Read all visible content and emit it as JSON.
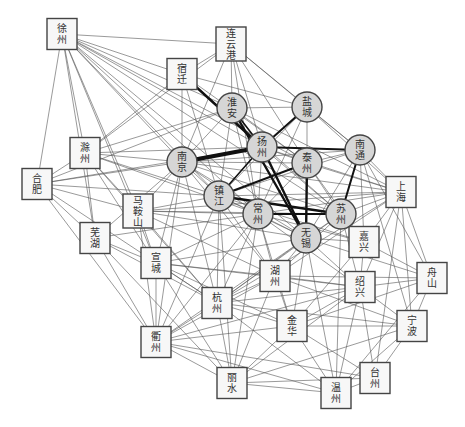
{
  "chart_data": {
    "type": "network",
    "title": "",
    "node_styles": {
      "core": "circle-gray",
      "peripheral": "square-white"
    },
    "nodes": [
      {
        "id": "xuzhou",
        "label": [
          "徐",
          "州"
        ],
        "shape": "box",
        "x": 62,
        "y": 34
      },
      {
        "id": "lianyungang",
        "label": [
          "连",
          "云",
          "港"
        ],
        "shape": "box",
        "x": 231,
        "y": 44
      },
      {
        "id": "suqian",
        "label": [
          "宿",
          "迁"
        ],
        "shape": "box",
        "x": 182,
        "y": 74
      },
      {
        "id": "chuzhou",
        "label": [
          "滁",
          "州"
        ],
        "shape": "box",
        "x": 85,
        "y": 153
      },
      {
        "id": "hefei",
        "label": [
          "合",
          "肥"
        ],
        "shape": "box",
        "x": 37,
        "y": 184
      },
      {
        "id": "maanshan",
        "label": [
          "马",
          "鞍",
          "山"
        ],
        "shape": "box",
        "x": 138,
        "y": 211
      },
      {
        "id": "wuhu",
        "label": [
          "芜",
          "湖"
        ],
        "shape": "box",
        "x": 95,
        "y": 238
      },
      {
        "id": "xuancheng",
        "label": [
          "宣",
          "城"
        ],
        "shape": "box",
        "x": 156,
        "y": 263
      },
      {
        "id": "hangzhou",
        "label": [
          "杭",
          "州"
        ],
        "shape": "box",
        "x": 217,
        "y": 303
      },
      {
        "id": "huzhou",
        "label": [
          "湖",
          "州"
        ],
        "shape": "box",
        "x": 275,
        "y": 276
      },
      {
        "id": "quzhou",
        "label": [
          "衢",
          "州"
        ],
        "shape": "box",
        "x": 156,
        "y": 342
      },
      {
        "id": "lishui",
        "label": [
          "丽",
          "水"
        ],
        "shape": "box",
        "x": 232,
        "y": 383
      },
      {
        "id": "jinhua",
        "label": [
          "金",
          "华"
        ],
        "shape": "box",
        "x": 292,
        "y": 326
      },
      {
        "id": "wenzhou",
        "label": [
          "温",
          "州"
        ],
        "shape": "box",
        "x": 336,
        "y": 393
      },
      {
        "id": "taizhou_zj",
        "label": [
          "台",
          "州"
        ],
        "shape": "box",
        "x": 375,
        "y": 378
      },
      {
        "id": "shaoxing",
        "label": [
          "绍",
          "兴"
        ],
        "shape": "box",
        "x": 360,
        "y": 287
      },
      {
        "id": "ningbo",
        "label": [
          "宁",
          "波"
        ],
        "shape": "box",
        "x": 412,
        "y": 326
      },
      {
        "id": "zhoushan",
        "label": [
          "舟",
          "山"
        ],
        "shape": "box",
        "x": 432,
        "y": 278
      },
      {
        "id": "jiaxing",
        "label": [
          "嘉",
          "兴"
        ],
        "shape": "box",
        "x": 364,
        "y": 242
      },
      {
        "id": "shanghai",
        "label": [
          "上",
          "海"
        ],
        "shape": "box",
        "x": 401,
        "y": 192
      },
      {
        "id": "huaian",
        "label": [
          "淮",
          "安"
        ],
        "shape": "circle",
        "x": 232,
        "y": 108
      },
      {
        "id": "yancheng",
        "label": [
          "盐",
          "城"
        ],
        "shape": "circle",
        "x": 307,
        "y": 107
      },
      {
        "id": "yangzhou",
        "label": [
          "扬",
          "州"
        ],
        "shape": "circle",
        "x": 262,
        "y": 147
      },
      {
        "id": "taizhou_js",
        "label": [
          "泰",
          "州"
        ],
        "shape": "circle",
        "x": 307,
        "y": 163
      },
      {
        "id": "nantong",
        "label": [
          "南",
          "通"
        ],
        "shape": "circle",
        "x": 360,
        "y": 150
      },
      {
        "id": "nanjing",
        "label": [
          "南",
          "京"
        ],
        "shape": "circle",
        "x": 182,
        "y": 162
      },
      {
        "id": "zhenjiang",
        "label": [
          "镇",
          "江"
        ],
        "shape": "circle",
        "x": 219,
        "y": 196
      },
      {
        "id": "changzhou",
        "label": [
          "常",
          "州"
        ],
        "shape": "circle",
        "x": 258,
        "y": 214
      },
      {
        "id": "suzhou",
        "label": [
          "苏",
          "州"
        ],
        "shape": "circle",
        "x": 341,
        "y": 214
      },
      {
        "id": "wuxi",
        "label": [
          "无",
          "锡"
        ],
        "shape": "circle",
        "x": 306,
        "y": 238
      }
    ],
    "strong_edges": [
      {
        "from": "nanjing",
        "to": "yangzhou",
        "weight": 4
      },
      {
        "from": "suqian",
        "to": "yangzhou",
        "weight": 2.4
      },
      {
        "from": "huaian",
        "to": "wuxi",
        "weight": 2.4
      },
      {
        "from": "yangzhou",
        "to": "wuxi",
        "weight": 2.4
      },
      {
        "from": "yancheng",
        "to": "yangzhou",
        "weight": 2
      },
      {
        "from": "yangzhou",
        "to": "nantong",
        "weight": 2
      },
      {
        "from": "zhenjiang",
        "to": "taizhou_js",
        "weight": 2
      },
      {
        "from": "zhenjiang",
        "to": "suzhou",
        "weight": 2.4
      },
      {
        "from": "changzhou",
        "to": "suzhou",
        "weight": 2
      },
      {
        "from": "taizhou_js",
        "to": "wuxi",
        "weight": 2.4
      },
      {
        "from": "nantong",
        "to": "suzhou",
        "weight": 2
      },
      {
        "from": "huaian",
        "to": "yangzhou",
        "weight": 1.6
      },
      {
        "from": "zhenjiang",
        "to": "yangzhou",
        "weight": 1.6
      }
    ],
    "weak_edges": [
      [
        "xuzhou",
        "lianyungang"
      ],
      [
        "xuzhou",
        "suqian"
      ],
      [
        "xuzhou",
        "huaian"
      ],
      [
        "xuzhou",
        "yangzhou"
      ],
      [
        "xuzhou",
        "nanjing"
      ],
      [
        "xuzhou",
        "zhenjiang"
      ],
      [
        "xuzhou",
        "chuzhou"
      ],
      [
        "xuzhou",
        "hefei"
      ],
      [
        "xuzhou",
        "maanshan"
      ],
      [
        "xuzhou",
        "wuhu"
      ],
      [
        "xuzhou",
        "changzhou"
      ],
      [
        "xuzhou",
        "wuxi"
      ],
      [
        "xuzhou",
        "suzhou"
      ],
      [
        "xuzhou",
        "taizhou_js"
      ],
      [
        "xuzhou",
        "xuancheng"
      ],
      [
        "lianyungang",
        "huaian"
      ],
      [
        "lianyungang",
        "yancheng"
      ],
      [
        "lianyungang",
        "suqian"
      ],
      [
        "lianyungang",
        "nanjing"
      ],
      [
        "lianyungang",
        "yangzhou"
      ],
      [
        "lianyungang",
        "taizhou_js"
      ],
      [
        "lianyungang",
        "changzhou"
      ],
      [
        "lianyungang",
        "nantong"
      ],
      [
        "lianyungang",
        "chuzhou"
      ],
      [
        "suqian",
        "nanjing"
      ],
      [
        "suqian",
        "yancheng"
      ],
      [
        "suqian",
        "taizhou_js"
      ],
      [
        "suqian",
        "chuzhou"
      ],
      [
        "suqian",
        "suzhou"
      ],
      [
        "suqian",
        "zhenjiang"
      ],
      [
        "huaian",
        "yancheng"
      ],
      [
        "huaian",
        "nanjing"
      ],
      [
        "huaian",
        "chuzhou"
      ],
      [
        "huaian",
        "taizhou_js"
      ],
      [
        "huaian",
        "zhenjiang"
      ],
      [
        "huaian",
        "changzhou"
      ],
      [
        "huaian",
        "hefei"
      ],
      [
        "huaian",
        "shanghai"
      ],
      [
        "yancheng",
        "taizhou_js"
      ],
      [
        "yancheng",
        "nantong"
      ],
      [
        "yancheng",
        "zhenjiang"
      ],
      [
        "yancheng",
        "changzhou"
      ],
      [
        "yancheng",
        "shanghai"
      ],
      [
        "chuzhou",
        "hefei"
      ],
      [
        "chuzhou",
        "nanjing"
      ],
      [
        "chuzhou",
        "maanshan"
      ],
      [
        "chuzhou",
        "wuhu"
      ],
      [
        "chuzhou",
        "yangzhou"
      ],
      [
        "chuzhou",
        "zhenjiang"
      ],
      [
        "chuzhou",
        "xuancheng"
      ],
      [
        "chuzhou",
        "changzhou"
      ],
      [
        "chuzhou",
        "hangzhou"
      ],
      [
        "hefei",
        "nanjing"
      ],
      [
        "hefei",
        "maanshan"
      ],
      [
        "hefei",
        "wuhu"
      ],
      [
        "hefei",
        "quzhou"
      ],
      [
        "hefei",
        "zhenjiang"
      ],
      [
        "hefei",
        "yangzhou"
      ],
      [
        "hefei",
        "hangzhou"
      ],
      [
        "maanshan",
        "nanjing"
      ],
      [
        "maanshan",
        "zhenjiang"
      ],
      [
        "maanshan",
        "xuancheng"
      ],
      [
        "maanshan",
        "changzhou"
      ],
      [
        "maanshan",
        "wuxi"
      ],
      [
        "maanshan",
        "suzhou"
      ],
      [
        "maanshan",
        "hangzhou"
      ],
      [
        "maanshan",
        "huzhou"
      ],
      [
        "maanshan",
        "shanghai"
      ],
      [
        "maanshan",
        "quzhou"
      ],
      [
        "wuhu",
        "nanjing"
      ],
      [
        "wuhu",
        "xuancheng"
      ],
      [
        "wuhu",
        "quzhou"
      ],
      [
        "wuhu",
        "hangzhou"
      ],
      [
        "wuhu",
        "lishui"
      ],
      [
        "wuhu",
        "changzhou"
      ],
      [
        "xuancheng",
        "nanjing"
      ],
      [
        "xuancheng",
        "quzhou"
      ],
      [
        "xuancheng",
        "hangzhou"
      ],
      [
        "xuancheng",
        "huzhou"
      ],
      [
        "xuancheng",
        "jinhua"
      ],
      [
        "xuancheng",
        "changzhou"
      ],
      [
        "xuancheng",
        "wuxi"
      ],
      [
        "xuancheng",
        "shaoxing"
      ],
      [
        "xuancheng",
        "lishui"
      ],
      [
        "nanjing",
        "zhenjiang"
      ],
      [
        "nanjing",
        "changzhou"
      ],
      [
        "nanjing",
        "wuxi"
      ],
      [
        "nanjing",
        "suzhou"
      ],
      [
        "nanjing",
        "taizhou_js"
      ],
      [
        "nanjing",
        "hangzhou"
      ],
      [
        "nanjing",
        "quzhou"
      ],
      [
        "nanjing",
        "huzhou"
      ],
      [
        "nanjing",
        "shanghai"
      ],
      [
        "nanjing",
        "nantong"
      ],
      [
        "zhenjiang",
        "changzhou"
      ],
      [
        "zhenjiang",
        "wuxi"
      ],
      [
        "zhenjiang",
        "quzhou"
      ],
      [
        "zhenjiang",
        "hangzhou"
      ],
      [
        "zhenjiang",
        "lishui"
      ],
      [
        "zhenjiang",
        "huzhou"
      ],
      [
        "zhenjiang",
        "shanghai"
      ],
      [
        "zhenjiang",
        "jiaxing"
      ],
      [
        "zhenjiang",
        "nantong"
      ],
      [
        "changzhou",
        "wuxi"
      ],
      [
        "changzhou",
        "huzhou"
      ],
      [
        "changzhou",
        "hangzhou"
      ],
      [
        "changzhou",
        "quzhou"
      ],
      [
        "changzhou",
        "shaoxing"
      ],
      [
        "changzhou",
        "jinhua"
      ],
      [
        "changzhou",
        "shanghai"
      ],
      [
        "changzhou",
        "jiaxing"
      ],
      [
        "changzhou",
        "lishui"
      ],
      [
        "yangzhou",
        "taizhou_js"
      ],
      [
        "yangzhou",
        "suzhou"
      ],
      [
        "yangzhou",
        "changzhou"
      ],
      [
        "yangzhou",
        "shanghai"
      ],
      [
        "taizhou_js",
        "nantong"
      ],
      [
        "taizhou_js",
        "suzhou"
      ],
      [
        "taizhou_js",
        "changzhou"
      ],
      [
        "taizhou_js",
        "shanghai"
      ],
      [
        "taizhou_js",
        "jiaxing"
      ],
      [
        "nantong",
        "shanghai"
      ],
      [
        "nantong",
        "wuxi"
      ],
      [
        "nantong",
        "jiaxing"
      ],
      [
        "nantong",
        "ningbo"
      ],
      [
        "nantong",
        "zhoushan"
      ],
      [
        "suzhou",
        "wuxi"
      ],
      [
        "suzhou",
        "shanghai"
      ],
      [
        "suzhou",
        "jiaxing"
      ],
      [
        "suzhou",
        "huzhou"
      ],
      [
        "suzhou",
        "shaoxing"
      ],
      [
        "suzhou",
        "wenzhou"
      ],
      [
        "suzhou",
        "hangzhou"
      ],
      [
        "wuxi",
        "huzhou"
      ],
      [
        "wuxi",
        "jiaxing"
      ],
      [
        "wuxi",
        "shaoxing"
      ],
      [
        "wuxi",
        "jinhua"
      ],
      [
        "wuxi",
        "hangzhou"
      ],
      [
        "wuxi",
        "wenzhou"
      ],
      [
        "wuxi",
        "quzhou"
      ],
      [
        "wuxi",
        "zhoushan"
      ],
      [
        "shanghai",
        "jiaxing"
      ],
      [
        "shanghai",
        "shaoxing"
      ],
      [
        "shanghai",
        "zhoushan"
      ],
      [
        "shanghai",
        "ningbo"
      ],
      [
        "shanghai",
        "taizhou_zj"
      ],
      [
        "shanghai",
        "hangzhou"
      ],
      [
        "shanghai",
        "huzhou"
      ],
      [
        "jiaxing",
        "shaoxing"
      ],
      [
        "jiaxing",
        "zhoushan"
      ],
      [
        "jiaxing",
        "jinhua"
      ],
      [
        "huzhou",
        "shaoxing"
      ],
      [
        "huzhou",
        "hangzhou"
      ],
      [
        "huzhou",
        "jinhua"
      ],
      [
        "huzhou",
        "quzhou"
      ],
      [
        "huzhou",
        "lishui"
      ],
      [
        "huzhou",
        "zhoushan"
      ],
      [
        "huzhou",
        "ningbo"
      ],
      [
        "hangzhou",
        "quzhou"
      ],
      [
        "hangzhou",
        "lishui"
      ],
      [
        "hangzhou",
        "jinhua"
      ],
      [
        "hangzhou",
        "shaoxing"
      ],
      [
        "hangzhou",
        "wenzhou"
      ],
      [
        "hangzhou",
        "ningbo"
      ],
      [
        "shaoxing",
        "zhoushan"
      ],
      [
        "shaoxing",
        "ningbo"
      ],
      [
        "shaoxing",
        "jinhua"
      ],
      [
        "shaoxing",
        "wenzhou"
      ],
      [
        "shaoxing",
        "taizhou_zj"
      ],
      [
        "shaoxing",
        "lishui"
      ],
      [
        "shaoxing",
        "quzhou"
      ],
      [
        "zhoushan",
        "ningbo"
      ],
      [
        "zhoushan",
        "wenzhou"
      ],
      [
        "zhoushan",
        "jinhua"
      ],
      [
        "ningbo",
        "jinhua"
      ],
      [
        "ningbo",
        "wenzhou"
      ],
      [
        "ningbo",
        "taizhou_zj"
      ],
      [
        "ningbo",
        "lishui"
      ],
      [
        "jinhua",
        "lishui"
      ],
      [
        "jinhua",
        "wenzhou"
      ],
      [
        "jinhua",
        "quzhou"
      ],
      [
        "jinhua",
        "taizhou_zj"
      ],
      [
        "wenzhou",
        "taizhou_zj"
      ],
      [
        "wenzhou",
        "lishui"
      ],
      [
        "wenzhou",
        "quzhou"
      ],
      [
        "lishui",
        "quzhou"
      ],
      [
        "lishui",
        "taizhou_zj"
      ],
      [
        "quzhou",
        "taizhou_zj"
      ]
    ]
  }
}
